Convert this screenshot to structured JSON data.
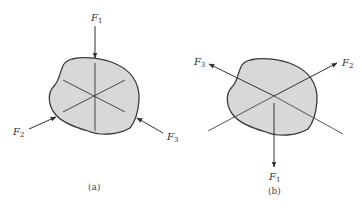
{
  "diagram_a": {
    "caption": "(a)",
    "forces": [
      {
        "name": "F",
        "sub": "1",
        "direction": "down, pointing into body from top"
      },
      {
        "name": "F",
        "sub": "2",
        "direction": "up-right, pointing into body from lower-left"
      },
      {
        "name": "F",
        "sub": "3",
        "direction": "up-left, pointing into body from lower-right"
      }
    ]
  },
  "diagram_b": {
    "caption": "(b)",
    "forces": [
      {
        "name": "F",
        "sub": "3",
        "direction": "up-left, pointing away from body"
      },
      {
        "name": "F",
        "sub": "2",
        "direction": "up-right, pointing away from body"
      },
      {
        "name": "F",
        "sub": "1",
        "direction": "down, pointing away from body"
      }
    ]
  },
  "colors": {
    "blob_fill": "#d8d8d8",
    "stroke": "#3a3a3a"
  }
}
